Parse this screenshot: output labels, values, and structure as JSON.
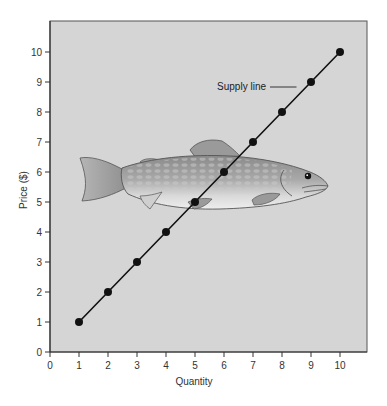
{
  "chart_data": {
    "type": "line",
    "title": "",
    "xlabel": "Quantity",
    "ylabel": "Price ($)",
    "xlim": [
      0,
      10
    ],
    "ylim": [
      0,
      10
    ],
    "x_ticks": [
      0,
      1,
      2,
      3,
      4,
      5,
      6,
      7,
      8,
      9,
      10
    ],
    "y_ticks": [
      0,
      1,
      2,
      3,
      4,
      5,
      6,
      7,
      8,
      9,
      10
    ],
    "grid": false,
    "background": "fish illustration",
    "series": [
      {
        "name": "Supply line",
        "x": [
          1,
          2,
          3,
          4,
          5,
          6,
          7,
          8,
          9,
          10
        ],
        "y": [
          1,
          2,
          3,
          4,
          5,
          6,
          7,
          8,
          9,
          10
        ],
        "color": "#111111",
        "markers": true
      }
    ],
    "annotations": [
      {
        "text": "Supply line",
        "points_to": [
          8.5,
          8.5
        ]
      }
    ],
    "colors": {
      "plot_background": "#d5d5d5",
      "axis": "#333333"
    }
  }
}
